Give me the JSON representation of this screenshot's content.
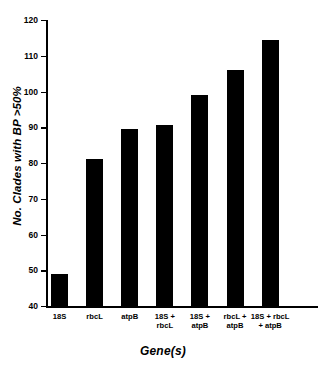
{
  "chart_data": {
    "type": "bar",
    "title": "",
    "xlabel": "Gene(s)",
    "ylabel": "No. Clades with BP >50%",
    "categories": [
      "18S",
      "rbcL",
      "atpB",
      "18S +\nrbcL",
      "18S +\natpB",
      "rbcL +\natpB",
      "18S + rbcL\n+ atpB"
    ],
    "values": [
      49,
      81,
      89.5,
      90.5,
      99,
      106,
      114.5
    ],
    "ylim": [
      40,
      120
    ],
    "yticks": [
      40,
      50,
      60,
      70,
      80,
      90,
      100,
      110,
      120
    ],
    "ytick_labels": [
      "40",
      "50",
      "60",
      "70",
      "80",
      "90",
      "100",
      "110",
      "120"
    ],
    "grid": false,
    "legend": "none",
    "bar_color": "#000000",
    "background_color": "#ffffff",
    "axis_color": "#000000"
  }
}
